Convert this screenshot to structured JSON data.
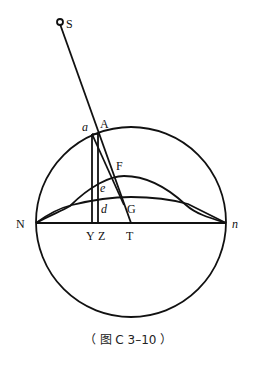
{
  "figure": {
    "caption": "（ 图 C 3–10 ）",
    "labels": {
      "S": "S",
      "A": "A",
      "a": "a",
      "F": "F",
      "e": "e",
      "d": "d",
      "G": "G",
      "N": "N",
      "n": "n",
      "Y": "Y",
      "Z": "Z",
      "T": "T"
    },
    "colors": {
      "line": "#111111",
      "background": "#ffffff"
    }
  }
}
